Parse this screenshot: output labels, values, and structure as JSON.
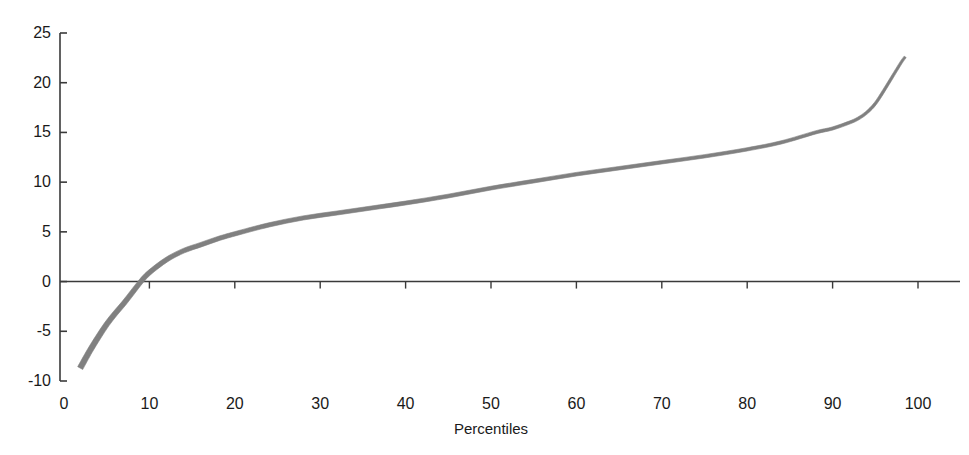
{
  "chart_data": {
    "type": "line",
    "title": "",
    "xlabel": "Percentiles",
    "ylabel": "",
    "xlim": [
      0,
      100
    ],
    "ylim": [
      -10,
      25
    ],
    "grid": false,
    "legend": null,
    "xticks": [
      "0",
      "10",
      "20",
      "30",
      "40",
      "50",
      "60",
      "70",
      "80",
      "90",
      "100"
    ],
    "xtick_values": [
      0,
      10,
      20,
      30,
      40,
      50,
      60,
      70,
      80,
      90,
      100
    ],
    "yticks": [
      "25",
      "20",
      "15",
      "10",
      "5",
      "0",
      "-5",
      "-10"
    ],
    "ytick_values": [
      25,
      20,
      15,
      10,
      5,
      0,
      -5,
      -10
    ],
    "series": [
      {
        "name": "percentile-curve",
        "color": "#808080",
        "x": [
          1.9,
          3,
          4,
          5,
          6,
          7,
          8,
          9,
          10,
          12,
          14,
          16,
          18,
          20,
          24,
          28,
          32,
          36,
          40,
          45,
          50,
          55,
          60,
          65,
          70,
          75,
          80,
          84,
          88,
          90,
          92,
          93,
          94,
          95,
          96,
          97,
          98,
          98.5
        ],
        "y": [
          -8.7,
          -7.0,
          -5.6,
          -4.3,
          -3.2,
          -2.2,
          -1.1,
          0.0,
          0.9,
          2.2,
          3.1,
          3.7,
          4.3,
          4.8,
          5.7,
          6.4,
          6.9,
          7.4,
          7.9,
          8.6,
          9.4,
          10.1,
          10.8,
          11.4,
          12.0,
          12.6,
          13.3,
          14.0,
          15.0,
          15.4,
          16.0,
          16.4,
          17.0,
          17.9,
          19.2,
          20.6,
          22.0,
          22.6
        ]
      }
    ],
    "zero_line": 0,
    "annotations": []
  },
  "axis_style": {
    "axis_color": "#3a3a3a",
    "curve_color": "#808080",
    "background": "#ffffff"
  }
}
